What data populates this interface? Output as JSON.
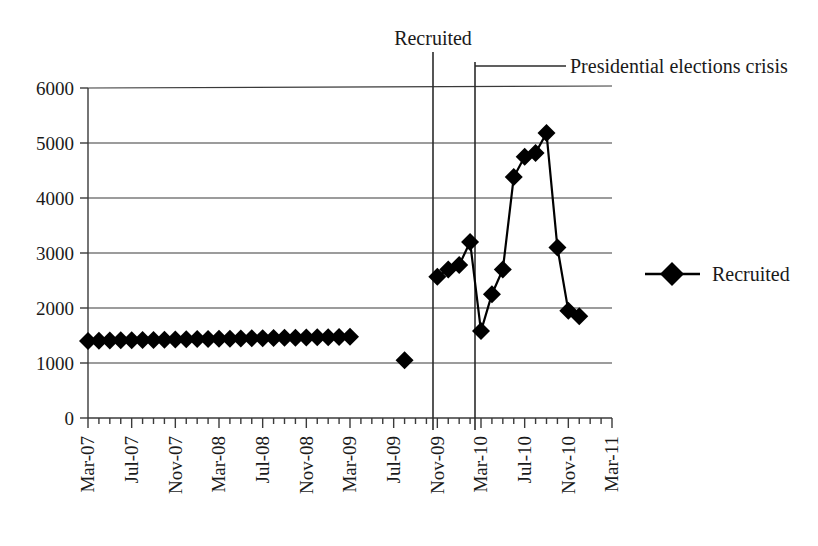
{
  "chart_data": {
    "type": "line",
    "title": "",
    "xlabel": "",
    "ylabel": "",
    "ylim": [
      0,
      6000
    ],
    "ytick_values": [
      0,
      1000,
      2000,
      3000,
      4000,
      5000,
      6000
    ],
    "ytick_labels": [
      "0",
      "1000",
      "2000",
      "3000",
      "4000",
      "5000",
      "6000"
    ],
    "xtick_labels": [
      "Mar-07",
      "Jul-07",
      "Nov-07",
      "Mar-08",
      "Jul-08",
      "Nov-08",
      "Mar-09",
      "Jul-09",
      "Nov-09",
      "Mar-10",
      "Jul-10",
      "Nov-10",
      "Mar-11"
    ],
    "xlim": [
      "Mar-07",
      "Mar-11"
    ],
    "grid": "horizontal",
    "legend_position": "right",
    "marker": "diamond",
    "series": [
      {
        "name": "Recruited",
        "x": [
          "Mar-07",
          "Apr-07",
          "May-07",
          "Jun-07",
          "Jul-07",
          "Aug-07",
          "Sep-07",
          "Oct-07",
          "Nov-07",
          "Dec-07",
          "Jan-08",
          "Feb-08",
          "Mar-08",
          "Apr-08",
          "May-08",
          "Jun-08",
          "Jul-08",
          "Aug-08",
          "Sep-08",
          "Oct-08",
          "Nov-08",
          "Dec-08",
          "Jan-09",
          "Feb-09",
          "Mar-09"
        ],
        "values": [
          1400,
          1405,
          1410,
          1412,
          1415,
          1418,
          1420,
          1425,
          1428,
          1430,
          1435,
          1438,
          1440,
          1443,
          1446,
          1450,
          1452,
          1455,
          1458,
          1460,
          1463,
          1466,
          1470,
          1474,
          1478
        ]
      },
      {
        "name": "Recruited-gap-point",
        "x": [
          "Aug-09"
        ],
        "values": [
          1050
        ]
      },
      {
        "name": "Recruited-late",
        "x": [
          "Nov-09",
          "Dec-09",
          "Jan-10",
          "Feb-10",
          "Mar-10",
          "Apr-10",
          "May-10",
          "Jun-10",
          "Jul-10",
          "Aug-10",
          "Sep-10",
          "Oct-10",
          "Nov-10",
          "Dec-10"
        ],
        "values": [
          2570,
          2700,
          2780,
          3200,
          1580,
          2250,
          2700,
          4380,
          4750,
          4820,
          5180,
          3100,
          1950,
          1850
        ]
      }
    ],
    "annotations": [
      {
        "label": "Recruited",
        "at_x": "Jan-10",
        "type": "vertical-line-with-label"
      },
      {
        "label": "Presidential elections crisis",
        "at_x": "May-10",
        "type": "vertical-line-with-leader"
      }
    ],
    "legend": [
      {
        "label": "Recruited",
        "marker": "diamond",
        "color": "#000000"
      }
    ]
  },
  "legend": {
    "entry_label": "Recruited"
  },
  "annotations": {
    "recruited": "Recruited",
    "crisis": "Presidential elections crisis"
  }
}
